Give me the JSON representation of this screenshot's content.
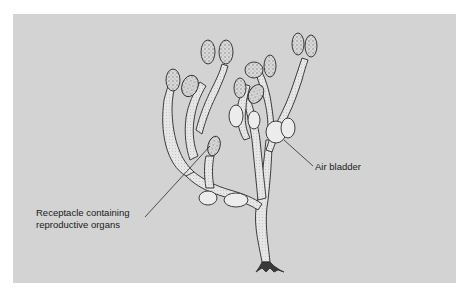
{
  "figure": {
    "background_color": "#d3d3d3",
    "line_color": "#2a2a2a",
    "frond_fill": "#e8e8e8"
  },
  "labels": {
    "receptacle": {
      "line1": "Receptacle containing",
      "line2": "reproductive organs"
    },
    "air_bladder": "Air bladder"
  }
}
